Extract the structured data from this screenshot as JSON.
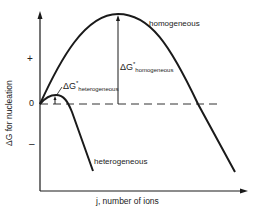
{
  "diagram": {
    "title": "",
    "y_axis": {
      "label": "ΔG  for nucleation",
      "ticks": {
        "plus": "+",
        "zero": "0",
        "minus": "–"
      }
    },
    "x_axis": {
      "label": "j,  number of ions"
    },
    "curves": [
      {
        "name": "homogeneous",
        "label": "homogeneous"
      },
      {
        "name": "heterogeneous",
        "label": "heterogeneous"
      }
    ],
    "annotations": {
      "dg_homogeneous": {
        "main": "ΔG",
        "sup": "*",
        "sub": "homogeneous"
      },
      "dg_heterogeneous": {
        "main": "ΔG",
        "sup": "*",
        "sub": "heterogeneous"
      }
    },
    "colors": {
      "line": "#1a1a1a",
      "dashed": "#333333"
    }
  }
}
